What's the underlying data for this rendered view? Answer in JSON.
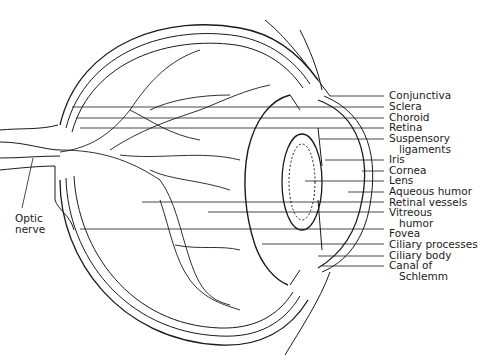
{
  "labels_right": [
    {
      "text": "Conjunctiva",
      "x": 389,
      "y": 90,
      "line_from": 330,
      "line_y": 96
    },
    {
      "text": "Sclera",
      "x": 389,
      "y": 101,
      "line_from": 72,
      "line_y": 107
    },
    {
      "text": "Choroid",
      "x": 389,
      "y": 112,
      "line_from": 76,
      "line_y": 118
    },
    {
      "text": "Retina",
      "x": 389,
      "y": 122,
      "line_from": 80,
      "line_y": 128
    },
    {
      "text": "Suspensory",
      "x": 389,
      "y": 133,
      "line_from": 320,
      "line_y": 139
    },
    {
      "text": "ligaments",
      "x": 399,
      "y": 144,
      "line_from": null,
      "line_y": null
    },
    {
      "text": "Iris",
      "x": 389,
      "y": 154,
      "line_from": 325,
      "line_y": 160
    },
    {
      "text": "Cornea",
      "x": 389,
      "y": 165,
      "line_from": 362,
      "line_y": 171
    },
    {
      "text": "Lens",
      "x": 389,
      "y": 175,
      "line_from": 305,
      "line_y": 181
    },
    {
      "text": "Aqueous humor",
      "x": 389,
      "y": 186,
      "line_from": 348,
      "line_y": 192
    },
    {
      "text": "Retinal vessels",
      "x": 389,
      "y": 197,
      "line_from": 142,
      "line_y": 202
    },
    {
      "text": "Vitreous",
      "x": 389,
      "y": 207,
      "line_from": 208,
      "line_y": 212
    },
    {
      "text": "humor",
      "x": 399,
      "y": 218,
      "line_from": null,
      "line_y": null
    },
    {
      "text": "Fovea",
      "x": 389,
      "y": 228,
      "line_from": 80,
      "line_y": 229
    },
    {
      "text": "Ciliary processes",
      "x": 389,
      "y": 239,
      "line_from": 262,
      "line_y": 244
    },
    {
      "text": "Ciliary body",
      "x": 389,
      "y": 250,
      "line_from": 318,
      "line_y": 256
    },
    {
      "text": "Canal of",
      "x": 389,
      "y": 260,
      "line_from": 322,
      "line_y": 266
    },
    {
      "text": "Schlemm",
      "x": 399,
      "y": 271,
      "line_from": null,
      "line_y": null
    }
  ],
  "labels_left": [
    {
      "text": "Optic",
      "x": 15,
      "y": 213
    },
    {
      "text": "nerve",
      "x": 15,
      "y": 224
    }
  ]
}
